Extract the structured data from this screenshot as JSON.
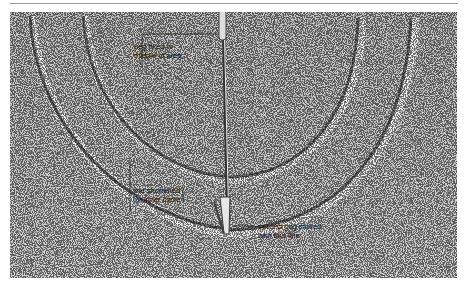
{
  "figure": {
    "colors": {
      "surface": "#c9c9c9",
      "groove_shadow": "#6e6e6e",
      "groove_highlight": "#f2f2f2",
      "annotation_line": "#222222"
    }
  },
  "annotations": [
    {
      "id": "peg-fixed",
      "line1": "peg fixed in",
      "line2": "middle of area"
    },
    {
      "id": "line-shortened",
      "line1": "line shortened",
      "line2": "for inner circle"
    },
    {
      "id": "second-peg",
      "line1": "second peg moved",
      "line2": "with taut line."
    }
  ]
}
